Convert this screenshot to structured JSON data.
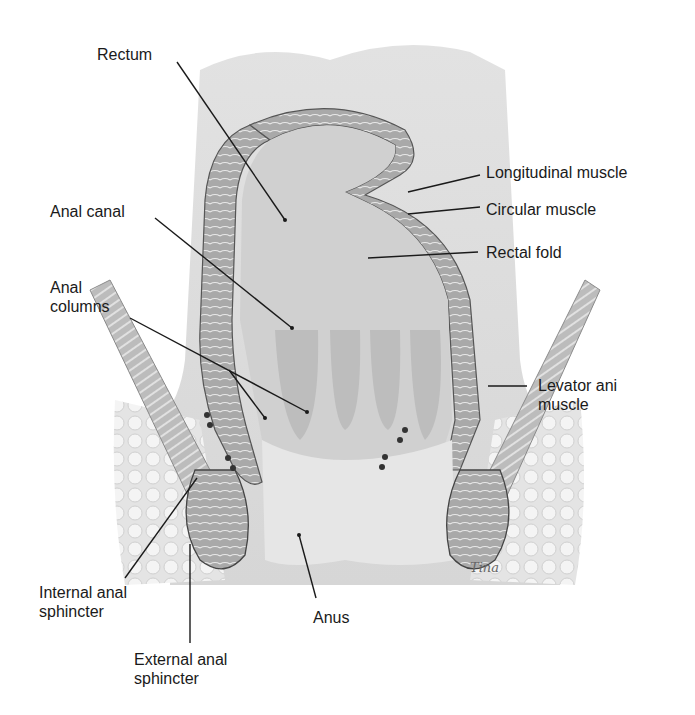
{
  "figure": {
    "type": "anatomical illustration",
    "colors": {
      "background": "#ffffff",
      "tissue_light": "#dcdcdc",
      "tissue_mid": "#c4c4c4",
      "muscle": "#a8a8a8",
      "lumen": "#d2d2d2",
      "fat": "#ececec",
      "leader_line": "#1a1a1a"
    }
  },
  "labels": {
    "rectum": "Rectum",
    "anal_canal": "Anal canal",
    "anal_columns": "Anal\ncolumns",
    "longitudinal_muscle": "Longitudinal muscle",
    "circular_muscle": "Circular muscle",
    "rectal_fold": "Rectal fold",
    "levator_ani": "Levator ani\nmuscle",
    "internal_sphincter": "Internal anal\nsphincter",
    "anus": "Anus",
    "external_sphincter": "External anal\nsphincter"
  },
  "signature": "Tina"
}
